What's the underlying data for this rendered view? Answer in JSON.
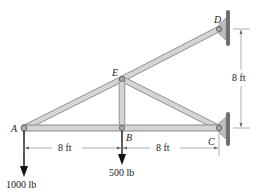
{
  "diagram": {
    "type": "truss",
    "joints": {
      "A": {
        "label": "A",
        "x": 24,
        "y": 128
      },
      "B": {
        "label": "B",
        "x": 122,
        "y": 128
      },
      "C": {
        "label": "C",
        "x": 219,
        "y": 128
      },
      "D": {
        "label": "D",
        "x": 219,
        "y": 29
      },
      "E": {
        "label": "E",
        "x": 122,
        "y": 79
      }
    },
    "members": [
      "AB",
      "BC",
      "AE",
      "ED",
      "EB",
      "EC"
    ],
    "supports": [
      "C",
      "D"
    ],
    "dimensions": {
      "ab": "8 ft",
      "bc": "8 ft",
      "cd": "8 ft"
    },
    "loads": {
      "A": "1000 lb",
      "B": "500 lb"
    },
    "colors": {
      "member_fill": "#d4d4d4",
      "member_stroke": "#8a8a8a",
      "wall": "#6e6e6e",
      "text": "#222222"
    }
  }
}
